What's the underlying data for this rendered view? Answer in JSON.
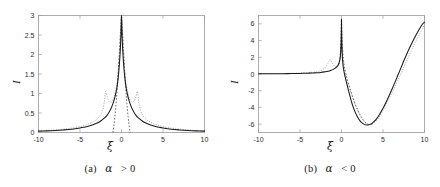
{
  "figure": {
    "background_color": "#ffffff",
    "panel_count": 2
  },
  "panel_a": {
    "caption_prefix": "(a)",
    "caption_symbol": "α",
    "caption_relation": "> 0",
    "caption_full": "(a) α > 0",
    "xlabel": "ξ",
    "ylabel": "I",
    "x_ticks": [
      "-10",
      "-5",
      "0",
      "5",
      "10"
    ],
    "y_ticks": [
      "0",
      "0.5",
      "1",
      "1.5",
      "2",
      "2.5",
      "3"
    ]
  },
  "panel_b": {
    "caption_prefix": "(b)",
    "caption_symbol": "α",
    "caption_relation": "< 0",
    "caption_full": "(b) α < 0",
    "xlabel": "ξ",
    "ylabel": "I",
    "x_ticks": [
      "-10",
      "-5",
      "0",
      "5",
      "10"
    ],
    "y_ticks": [
      "-6",
      "-4",
      "-2",
      "0",
      "2",
      "4",
      "6"
    ]
  },
  "chart_data": [
    {
      "type": "line",
      "panel": "a",
      "title": "(a) α > 0",
      "xlabel": "ξ",
      "ylabel": "I",
      "xlim": [
        -10,
        10
      ],
      "ylim": [
        0,
        3
      ],
      "xticks": [
        -10,
        -5,
        0,
        5,
        10
      ],
      "yticks": [
        0,
        0.5,
        1,
        1.5,
        2,
        2.5,
        3
      ],
      "grid": false,
      "legend": "none",
      "series": [
        {
          "name": "solid-black",
          "style": "solid",
          "color": "#1a1a1a",
          "x": [
            -10,
            -9,
            -8,
            -7,
            -6,
            -5,
            -4.5,
            -4,
            -3.5,
            -3,
            -2.5,
            -2,
            -1.75,
            -1.5,
            -1.25,
            -1,
            -0.85,
            -0.7,
            -0.55,
            -0.4,
            -0.28,
            -0.18,
            -0.1,
            -0.05,
            -0.02,
            0,
            0.02,
            0.05,
            0.1,
            0.18,
            0.28,
            0.4,
            0.55,
            0.7,
            0.85,
            1,
            1.25,
            1.5,
            1.75,
            2,
            2.5,
            3,
            3.5,
            4,
            4.5,
            5,
            6,
            7,
            8,
            9,
            10
          ],
          "y": [
            0.035,
            0.042,
            0.052,
            0.066,
            0.085,
            0.115,
            0.135,
            0.16,
            0.192,
            0.235,
            0.295,
            0.38,
            0.44,
            0.52,
            0.62,
            0.76,
            0.86,
            0.99,
            1.16,
            1.4,
            1.68,
            1.98,
            2.32,
            2.6,
            2.86,
            3.0,
            2.86,
            2.6,
            2.32,
            1.98,
            1.68,
            1.4,
            1.16,
            0.99,
            0.86,
            0.76,
            0.62,
            0.52,
            0.44,
            0.38,
            0.295,
            0.235,
            0.192,
            0.16,
            0.135,
            0.115,
            0.085,
            0.066,
            0.052,
            0.042,
            0.035
          ]
        },
        {
          "name": "dashed-dark",
          "style": "dashed",
          "color": "#565656",
          "x": [
            -1.05,
            -1.0,
            -0.9,
            -0.8,
            -0.7,
            -0.6,
            -0.5,
            -0.4,
            -0.3,
            -0.22,
            -0.15,
            -0.09,
            -0.05,
            -0.02,
            0,
            0.02,
            0.05,
            0.09,
            0.15,
            0.22,
            0.3,
            0.4,
            0.5,
            0.6,
            0.7,
            0.8,
            0.9,
            1.0,
            1.05
          ],
          "y": [
            0.0,
            0.05,
            0.2,
            0.4,
            0.62,
            0.88,
            1.18,
            1.52,
            1.9,
            2.2,
            2.47,
            2.68,
            2.83,
            2.95,
            3.0,
            2.95,
            2.83,
            2.68,
            2.47,
            2.2,
            1.9,
            1.52,
            1.18,
            0.88,
            0.62,
            0.4,
            0.2,
            0.05,
            0.0
          ]
        },
        {
          "name": "dotted-gray",
          "style": "dotted",
          "color": "#9d9d9d",
          "x": [
            -10,
            -9,
            -8,
            -7,
            -6,
            -5,
            -4.5,
            -4,
            -3.5,
            -3,
            -2.6,
            -2.3,
            -2.1,
            -2.0,
            -1.95,
            -1.9,
            -1.7,
            -1.5,
            -1.25,
            -1,
            -0.8,
            -0.6,
            -0.45,
            -0.3,
            -0.2,
            -0.12,
            -0.06,
            -0.02,
            0,
            0.02,
            0.06,
            0.12,
            0.2,
            0.3,
            0.45,
            0.6,
            0.8,
            1,
            1.25,
            1.5,
            1.7,
            1.9,
            1.95,
            2.0,
            2.1,
            2.3,
            2.6,
            3,
            3.5,
            4,
            4.5,
            5,
            6,
            7,
            8,
            9,
            10
          ],
          "y": [
            0.045,
            0.055,
            0.068,
            0.086,
            0.112,
            0.152,
            0.18,
            0.215,
            0.265,
            0.335,
            0.43,
            0.56,
            0.74,
            0.92,
            1.02,
            1.05,
            0.9,
            0.8,
            0.78,
            0.85,
            0.98,
            1.2,
            1.45,
            1.85,
            2.2,
            2.55,
            2.8,
            2.95,
            3.0,
            2.95,
            2.8,
            2.55,
            2.2,
            1.85,
            1.45,
            1.2,
            0.98,
            0.85,
            0.78,
            0.8,
            0.9,
            1.05,
            1.02,
            0.92,
            0.74,
            0.56,
            0.43,
            0.335,
            0.265,
            0.215,
            0.18,
            0.152,
            0.112,
            0.086,
            0.068,
            0.055,
            0.045
          ]
        }
      ]
    },
    {
      "type": "line",
      "panel": "b",
      "title": "(b) α < 0",
      "xlabel": "ξ",
      "ylabel": "I",
      "xlim": [
        -10,
        10
      ],
      "ylim": [
        -7,
        7
      ],
      "xticks": [
        -10,
        -5,
        0,
        5,
        10
      ],
      "yticks": [
        -6,
        -4,
        -2,
        0,
        2,
        4,
        6
      ],
      "grid": false,
      "legend": "none",
      "series": [
        {
          "name": "solid-black",
          "style": "solid",
          "color": "#1a1a1a",
          "x": [
            -10,
            -9,
            -8,
            -7,
            -6,
            -5,
            -4,
            -3.5,
            -3,
            -2.5,
            -2,
            -1.6,
            -1.3,
            -1,
            -0.8,
            -0.6,
            -0.45,
            -0.32,
            -0.22,
            -0.14,
            -0.08,
            -0.04,
            -0.015,
            0,
            0.015,
            0.05,
            0.1,
            0.2,
            0.35,
            0.5,
            0.7,
            0.9,
            1.2,
            1.5,
            1.9,
            2.3,
            2.7,
            3.0,
            3.2,
            3.5,
            3.8,
            4.2,
            4.6,
            5.0,
            5.5,
            6.0,
            6.5,
            7.0,
            7.5,
            8.0,
            8.5,
            9.0,
            9.4,
            9.7,
            10
          ],
          "y": [
            0.02,
            0.025,
            0.032,
            0.04,
            0.05,
            0.07,
            0.1,
            0.12,
            0.15,
            0.19,
            0.26,
            0.33,
            0.42,
            0.55,
            0.67,
            0.83,
            1.0,
            1.25,
            1.6,
            2.1,
            2.9,
            4.0,
            5.4,
            6.55,
            5.2,
            3.4,
            2.1,
            0.9,
            0.05,
            -0.6,
            -1.4,
            -2.2,
            -3.3,
            -4.2,
            -5.1,
            -5.7,
            -6.0,
            -6.1,
            -6.1,
            -6.0,
            -5.8,
            -5.4,
            -4.8,
            -4.1,
            -3.1,
            -2.0,
            -0.85,
            0.35,
            1.55,
            2.7,
            3.75,
            4.7,
            5.4,
            5.9,
            6.2
          ]
        },
        {
          "name": "dotted-gray",
          "style": "dotted",
          "color": "#9d9d9d",
          "x": [
            -10,
            -9,
            -8,
            -7,
            -6,
            -5,
            -4,
            -3.5,
            -3,
            -2.6,
            -2.3,
            -2.0,
            -1.8,
            -1.6,
            -1.45,
            -1.35,
            -1.3,
            -1.2,
            -1.0,
            -0.8,
            -0.6,
            -0.45,
            -0.3,
            -0.2,
            -0.12,
            -0.06,
            -0.02,
            0,
            0.05,
            0.15,
            0.3,
            0.5,
            0.75,
            1.0,
            1.3,
            1.7,
            2.1,
            2.5,
            3.0,
            3.5,
            4.0,
            4.6,
            5.2,
            6.0,
            7.0,
            8.0,
            9.0,
            10
          ],
          "y": [
            0.03,
            0.04,
            0.05,
            0.065,
            0.085,
            0.12,
            0.17,
            0.21,
            0.27,
            0.36,
            0.5,
            0.74,
            0.98,
            1.3,
            1.62,
            1.8,
            1.72,
            1.45,
            1.1,
            0.9,
            0.85,
            0.92,
            1.2,
            1.55,
            2.15,
            3.1,
            4.6,
            5.3,
            3.5,
            1.85,
            0.6,
            -0.35,
            -1.1,
            -1.8,
            -2.7,
            -3.8,
            -4.7,
            -5.4,
            -5.95,
            -6.05,
            -5.75,
            -5.05,
            -4.0,
            -2.4,
            -0.3,
            1.9,
            4.0,
            5.9
          ]
        },
        {
          "name": "dashed-dark",
          "style": "dashed",
          "color": "#565656",
          "x": [
            -0.35,
            -0.25,
            -0.18,
            -0.12,
            -0.07,
            -0.03,
            0,
            0.05,
            0.15,
            0.3,
            0.5,
            0.8,
            1.2,
            1.7,
            2.2,
            2.8,
            3.3,
            3.9
          ],
          "y": [
            1.1,
            1.5,
            2.0,
            2.8,
            4.0,
            5.4,
            6.5,
            4.6,
            2.7,
            1.2,
            0.1,
            -1.0,
            -2.3,
            -3.7,
            -4.8,
            -5.7,
            -6.05,
            -5.95
          ]
        }
      ]
    }
  ]
}
